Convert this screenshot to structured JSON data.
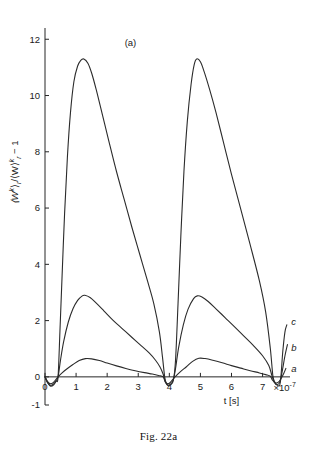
{
  "figure": {
    "panel_label": "(a)",
    "caption": "Fig. 22a"
  },
  "axes": {
    "y_title_parts": {
      "part1": "⟨W",
      "part1_sup": "k",
      "part2": "⟩",
      "part2_sub": "r",
      "slash": "/",
      "part3": "⟨W⟩",
      "part3_sup": "k",
      "part3_sub": "r",
      "tail": "− 1"
    },
    "y_title": "⟨Wᵏ⟩ᵣ / ⟨W⟩ᵣᵏ − 1",
    "x_title": "t [s]",
    "x_multiplier_prefix": "×10",
    "x_multiplier_exponent": "-7",
    "y_ticks": [
      "-1",
      "0",
      "2",
      "4",
      "6",
      "8",
      "10",
      "12"
    ],
    "x_ticks": [
      "0",
      "1",
      "2",
      "3",
      "4",
      "5",
      "6",
      "7"
    ]
  },
  "curve_labels": {
    "a": "a",
    "b": "b",
    "c": "c"
  },
  "chart_data": {
    "type": "line",
    "title": "(a)",
    "xlabel": "t [s]",
    "ylabel": "⟨Wᵏ⟩ᵣ / ⟨W⟩ᵣᵏ − 1",
    "x_unit_multiplier": "×10^-7",
    "xlim": [
      0,
      7.85
    ],
    "ylim": [
      -1,
      12.4
    ],
    "xticks": [
      0,
      1,
      2,
      3,
      4,
      5,
      6,
      7
    ],
    "yticks": [
      -1,
      0,
      2,
      4,
      6,
      8,
      10,
      12
    ],
    "grid": false,
    "legend": "inline curve labels at right edge (a, b, c)",
    "annotations": [
      {
        "text": "(a)",
        "x": 2.6,
        "y": 12.0,
        "role": "panel-label"
      },
      {
        "text": "c",
        "x": 7.8,
        "y": 1.7,
        "role": "curve-label"
      },
      {
        "text": "b",
        "x": 7.8,
        "y": 1.0,
        "role": "curve-label"
      },
      {
        "text": "a",
        "x": 7.8,
        "y": 0.35,
        "role": "curve-label"
      },
      {
        "text": "×10⁻⁷",
        "x": 7.5,
        "y": -0.38,
        "role": "axis-multiplier"
      }
    ],
    "series": [
      {
        "name": "a",
        "label": "a",
        "peak_values": [
          0.65,
          0.66
        ],
        "peak_times": [
          1.3,
          4.95
        ],
        "zero_times": [
          0.42,
          3.85,
          7.3
        ],
        "points": [
          [
            0.0,
            0.0
          ],
          [
            0.08,
            -0.16
          ],
          [
            0.16,
            -0.24
          ],
          [
            0.25,
            -0.22
          ],
          [
            0.33,
            -0.12
          ],
          [
            0.42,
            0.0
          ],
          [
            0.55,
            0.14
          ],
          [
            0.7,
            0.28
          ],
          [
            0.9,
            0.44
          ],
          [
            1.1,
            0.58
          ],
          [
            1.3,
            0.65
          ],
          [
            1.5,
            0.64
          ],
          [
            1.75,
            0.58
          ],
          [
            2.0,
            0.49
          ],
          [
            2.3,
            0.39
          ],
          [
            2.6,
            0.3
          ],
          [
            2.9,
            0.22
          ],
          [
            3.2,
            0.15
          ],
          [
            3.45,
            0.1
          ],
          [
            3.65,
            0.05
          ],
          [
            3.8,
            0.0
          ],
          [
            3.87,
            -0.18
          ],
          [
            3.95,
            -0.25
          ],
          [
            4.03,
            -0.2
          ],
          [
            4.12,
            -0.08
          ],
          [
            4.2,
            0.02
          ],
          [
            4.35,
            0.18
          ],
          [
            4.55,
            0.36
          ],
          [
            4.75,
            0.55
          ],
          [
            4.95,
            0.66
          ],
          [
            5.15,
            0.65
          ],
          [
            5.4,
            0.59
          ],
          [
            5.7,
            0.5
          ],
          [
            6.0,
            0.4
          ],
          [
            6.3,
            0.31
          ],
          [
            6.6,
            0.22
          ],
          [
            6.9,
            0.14
          ],
          [
            7.1,
            0.08
          ],
          [
            7.25,
            0.02
          ],
          [
            7.32,
            -0.12
          ],
          [
            7.42,
            -0.22
          ],
          [
            7.52,
            -0.18
          ],
          [
            7.6,
            -0.05
          ],
          [
            7.68,
            0.12
          ],
          [
            7.75,
            0.3
          ]
        ]
      },
      {
        "name": "b",
        "label": "b",
        "peak_values": [
          2.9,
          2.88
        ],
        "peak_times": [
          1.28,
          4.9
        ],
        "zero_times": [
          0.42,
          3.85,
          7.3
        ],
        "points": [
          [
            0.0,
            0.0
          ],
          [
            0.08,
            -0.2
          ],
          [
            0.17,
            -0.3
          ],
          [
            0.27,
            -0.26
          ],
          [
            0.35,
            -0.14
          ],
          [
            0.42,
            0.0
          ],
          [
            0.5,
            0.6
          ],
          [
            0.6,
            1.25
          ],
          [
            0.75,
            1.95
          ],
          [
            0.9,
            2.42
          ],
          [
            1.05,
            2.72
          ],
          [
            1.2,
            2.88
          ],
          [
            1.28,
            2.9
          ],
          [
            1.45,
            2.82
          ],
          [
            1.65,
            2.62
          ],
          [
            1.9,
            2.34
          ],
          [
            2.2,
            2.0
          ],
          [
            2.5,
            1.7
          ],
          [
            2.8,
            1.4
          ],
          [
            3.1,
            1.1
          ],
          [
            3.35,
            0.85
          ],
          [
            3.55,
            0.6
          ],
          [
            3.7,
            0.35
          ],
          [
            3.8,
            0.1
          ],
          [
            3.88,
            -0.2
          ],
          [
            3.96,
            -0.3
          ],
          [
            4.05,
            -0.25
          ],
          [
            4.13,
            -0.1
          ],
          [
            4.2,
            0.3
          ],
          [
            4.3,
            1.05
          ],
          [
            4.45,
            1.85
          ],
          [
            4.6,
            2.4
          ],
          [
            4.78,
            2.78
          ],
          [
            4.9,
            2.88
          ],
          [
            5.05,
            2.84
          ],
          [
            5.25,
            2.68
          ],
          [
            5.5,
            2.42
          ],
          [
            5.8,
            2.1
          ],
          [
            6.1,
            1.78
          ],
          [
            6.4,
            1.45
          ],
          [
            6.7,
            1.12
          ],
          [
            7.0,
            0.75
          ],
          [
            7.2,
            0.4
          ],
          [
            7.3,
            0.05
          ],
          [
            7.38,
            -0.2
          ],
          [
            7.47,
            -0.28
          ],
          [
            7.56,
            -0.18
          ],
          [
            7.64,
            0.25
          ],
          [
            7.72,
            0.75
          ],
          [
            7.8,
            1.15
          ]
        ]
      },
      {
        "name": "c",
        "label": "c",
        "peak_values": [
          11.3,
          11.3
        ],
        "peak_times": [
          1.25,
          4.88
        ],
        "zero_times": [
          0.42,
          3.85,
          7.3
        ],
        "points": [
          [
            0.0,
            0.0
          ],
          [
            0.09,
            -0.22
          ],
          [
            0.18,
            -0.33
          ],
          [
            0.28,
            -0.28
          ],
          [
            0.36,
            -0.15
          ],
          [
            0.42,
            0.0
          ],
          [
            0.48,
            1.6
          ],
          [
            0.55,
            3.6
          ],
          [
            0.63,
            5.8
          ],
          [
            0.72,
            7.8
          ],
          [
            0.82,
            9.4
          ],
          [
            0.93,
            10.5
          ],
          [
            1.05,
            11.05
          ],
          [
            1.15,
            11.25
          ],
          [
            1.25,
            11.3
          ],
          [
            1.38,
            11.15
          ],
          [
            1.5,
            10.8
          ],
          [
            1.65,
            10.2
          ],
          [
            1.85,
            9.3
          ],
          [
            2.05,
            8.4
          ],
          [
            2.3,
            7.3
          ],
          [
            2.55,
            6.3
          ],
          [
            2.8,
            5.3
          ],
          [
            3.05,
            4.35
          ],
          [
            3.3,
            3.4
          ],
          [
            3.5,
            2.6
          ],
          [
            3.68,
            1.6
          ],
          [
            3.78,
            0.7
          ],
          [
            3.85,
            0.0
          ],
          [
            3.9,
            -0.22
          ],
          [
            3.97,
            -0.32
          ],
          [
            4.05,
            -0.27
          ],
          [
            4.13,
            -0.12
          ],
          [
            4.2,
            0.6
          ],
          [
            4.28,
            2.6
          ],
          [
            4.37,
            5.0
          ],
          [
            4.47,
            7.3
          ],
          [
            4.58,
            9.1
          ],
          [
            4.7,
            10.4
          ],
          [
            4.8,
            11.1
          ],
          [
            4.88,
            11.3
          ],
          [
            5.0,
            11.2
          ],
          [
            5.12,
            10.85
          ],
          [
            5.3,
            10.2
          ],
          [
            5.5,
            9.4
          ],
          [
            5.75,
            8.3
          ],
          [
            6.0,
            7.2
          ],
          [
            6.3,
            5.95
          ],
          [
            6.6,
            4.7
          ],
          [
            6.9,
            3.4
          ],
          [
            7.1,
            2.3
          ],
          [
            7.25,
            1.0
          ],
          [
            7.33,
            0.05
          ],
          [
            7.4,
            -0.2
          ],
          [
            7.48,
            -0.3
          ],
          [
            7.57,
            -0.2
          ],
          [
            7.65,
            0.9
          ],
          [
            7.72,
            1.6
          ],
          [
            7.78,
            1.85
          ]
        ]
      }
    ]
  }
}
